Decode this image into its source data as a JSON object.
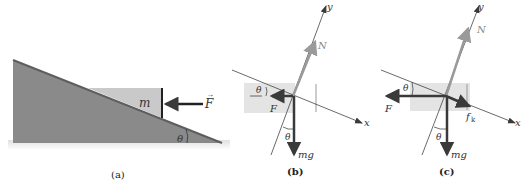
{
  "panels": [
    {
      "id": "a",
      "caption": "(a)",
      "mass_label": "m",
      "force_label": "F",
      "angle_label": "θ"
    },
    {
      "id": "b",
      "caption": "(b)",
      "x_axis_label": "x",
      "y_axis_label": "y",
      "normal_label": "N",
      "force_label": "F",
      "weight_label": "mg",
      "angle_label_1": "θ",
      "angle_label_2": "θ"
    },
    {
      "id": "c",
      "caption": "(c)",
      "x_axis_label": "x",
      "y_axis_label": "y",
      "normal_label": "N",
      "force_label": "F",
      "friction_label": "f",
      "friction_subscript": "k",
      "weight_label": "mg",
      "angle_label_1": "θ",
      "angle_label_2": "θ"
    }
  ],
  "colors": {
    "incline": "#8a8a8a",
    "incline_edge": "#5e5e5e",
    "block": "#c9c9c9",
    "block_ghost": "#e4e4e4",
    "arrow_dark": "#3a3a3a",
    "arrow_normal": "#9a9a9a",
    "axis": "#4a4a4a"
  }
}
